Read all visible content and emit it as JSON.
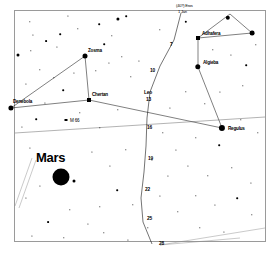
{
  "chart": {
    "type": "star-chart",
    "frame": {
      "x": 14,
      "y": 10,
      "width": 252,
      "height": 232,
      "border_color": "#9a9a9a"
    },
    "background": "#ffffff",
    "ink": "#000000"
  },
  "planet": {
    "name": "Mars",
    "label_x": 36,
    "label_y": 157,
    "disc_x": 61,
    "disc_y": 177,
    "disc_radius": 8.5,
    "companion_x": 74,
    "companion_y": 181,
    "companion_radius": 1.5
  },
  "named_stars": [
    {
      "name": "Zosma",
      "label_x": 88,
      "label_y": 50,
      "star_x": 85,
      "star_y": 56,
      "mag_size": 5.0
    },
    {
      "name": "Chertan",
      "label_x": 92,
      "label_y": 94,
      "star_x": 89,
      "star_y": 100,
      "mag_size": 4.0
    },
    {
      "name": "Denebola",
      "label_x": 13,
      "label_y": 101,
      "star_x": 11,
      "star_y": 108,
      "mag_size": 5.2
    },
    {
      "name": "Adhafera",
      "label_x": 202,
      "label_y": 33,
      "star_x": 198,
      "star_y": 38,
      "mag_size": 4.0
    },
    {
      "name": "Algieba",
      "label_x": 203,
      "label_y": 62,
      "star_x": 198,
      "star_y": 67,
      "mag_size": 5.4
    },
    {
      "name": "Regulus",
      "label_x": 228,
      "label_y": 128,
      "star_x": 222,
      "star_y": 128,
      "mag_size": 6.2
    }
  ],
  "deep_sky_objects": [
    {
      "name": "M 66",
      "label_x": 70,
      "label_y": 120,
      "marker_x": 66,
      "marker_y": 120
    }
  ],
  "top_annotations": [
    {
      "text": "(40?) Eros",
      "x": 176,
      "y": 5
    },
    {
      "text": "1 Jan",
      "x": 178,
      "y": 11
    }
  ],
  "path_markers": [
    {
      "label": "7",
      "x": 170,
      "y": 44
    },
    {
      "label": "10",
      "x": 150,
      "y": 70
    },
    {
      "label": "Leo",
      "x": 144,
      "y": 92
    },
    {
      "label": "13",
      "x": 146,
      "y": 99
    },
    {
      "label": "16",
      "x": 147,
      "y": 127
    },
    {
      "label": "19",
      "x": 148,
      "y": 158
    },
    {
      "label": "22",
      "x": 145,
      "y": 189
    },
    {
      "label": "25",
      "x": 147,
      "y": 218
    },
    {
      "label": "28",
      "x": 159,
      "y": 243
    }
  ],
  "constellation_lines": [
    {
      "from": [
        11,
        108
      ],
      "to": [
        85,
        56
      ]
    },
    {
      "from": [
        85,
        56
      ],
      "to": [
        89,
        100
      ]
    },
    {
      "from": [
        11,
        108
      ],
      "to": [
        89,
        100
      ]
    },
    {
      "from": [
        89,
        100
      ],
      "to": [
        222,
        128
      ]
    },
    {
      "from": [
        198,
        67
      ],
      "to": [
        222,
        128
      ]
    },
    {
      "from": [
        198,
        67
      ],
      "to": [
        198,
        38
      ]
    },
    {
      "from": [
        198,
        38
      ],
      "to": [
        252,
        33
      ]
    },
    {
      "from": [
        252,
        33
      ],
      "to": [
        230,
        14
      ]
    },
    {
      "from": [
        230,
        14
      ],
      "to": [
        198,
        38
      ]
    }
  ],
  "path_line": [
    [
      181,
      13
    ],
    [
      174,
      40
    ],
    [
      160,
      66
    ],
    [
      150,
      92
    ],
    [
      147,
      118
    ],
    [
      146,
      146
    ],
    [
      144,
      172
    ],
    [
      141,
      198
    ],
    [
      143,
      222
    ],
    [
      152,
      244
    ]
  ],
  "ecliptic_line": {
    "from": [
      15,
      133
    ],
    "to": [
      265,
      117
    ]
  },
  "corner_lines": [
    {
      "from": [
        15,
        206
      ],
      "to": [
        32,
        158
      ]
    },
    {
      "from": [
        19,
        208
      ],
      "to": [
        36,
        160
      ]
    },
    {
      "from": [
        160,
        245
      ],
      "to": [
        265,
        228
      ]
    },
    {
      "from": [
        160,
        245
      ],
      "to": [
        240,
        238
      ]
    }
  ],
  "field_stars": [
    {
      "x": 30,
      "y": 22,
      "r": 0.7
    },
    {
      "x": 46,
      "y": 41,
      "r": 0.9
    },
    {
      "x": 31,
      "y": 51,
      "r": 0.7
    },
    {
      "x": 18,
      "y": 55,
      "r": 1.5
    },
    {
      "x": 60,
      "y": 34,
      "r": 0.8
    },
    {
      "x": 57,
      "y": 47,
      "r": 0.6
    },
    {
      "x": 33,
      "y": 35,
      "r": 0.6
    },
    {
      "x": 68,
      "y": 16,
      "r": 0.6
    },
    {
      "x": 78,
      "y": 29,
      "r": 0.7
    },
    {
      "x": 99,
      "y": 24,
      "r": 0.8
    },
    {
      "x": 104,
      "y": 44,
      "r": 0.8
    },
    {
      "x": 112,
      "y": 36,
      "r": 0.7
    },
    {
      "x": 118,
      "y": 19,
      "r": 1.6
    },
    {
      "x": 126,
      "y": 16,
      "r": 0.8
    },
    {
      "x": 122,
      "y": 57,
      "r": 0.7
    },
    {
      "x": 109,
      "y": 63,
      "r": 0.6
    },
    {
      "x": 96,
      "y": 71,
      "r": 0.7
    },
    {
      "x": 74,
      "y": 73,
      "r": 0.6
    },
    {
      "x": 54,
      "y": 78,
      "r": 0.7
    },
    {
      "x": 40,
      "y": 70,
      "r": 0.7
    },
    {
      "x": 26,
      "y": 84,
      "r": 0.6
    },
    {
      "x": 63,
      "y": 90,
      "r": 0.8
    },
    {
      "x": 80,
      "y": 113,
      "r": 0.7
    },
    {
      "x": 45,
      "y": 103,
      "r": 0.6
    },
    {
      "x": 36,
      "y": 119,
      "r": 0.8
    },
    {
      "x": 22,
      "y": 127,
      "r": 0.6
    },
    {
      "x": 100,
      "y": 128,
      "r": 0.7
    },
    {
      "x": 118,
      "y": 110,
      "r": 0.7
    },
    {
      "x": 131,
      "y": 77,
      "r": 0.7
    },
    {
      "x": 139,
      "y": 61,
      "r": 0.6
    },
    {
      "x": 160,
      "y": 30,
      "r": 0.7
    },
    {
      "x": 186,
      "y": 22,
      "r": 1.2
    },
    {
      "x": 213,
      "y": 50,
      "r": 0.7
    },
    {
      "x": 231,
      "y": 55,
      "r": 0.6
    },
    {
      "x": 246,
      "y": 65,
      "r": 0.8
    },
    {
      "x": 256,
      "y": 45,
      "r": 0.7
    },
    {
      "x": 243,
      "y": 86,
      "r": 0.7
    },
    {
      "x": 220,
      "y": 92,
      "r": 0.6
    },
    {
      "x": 205,
      "y": 104,
      "r": 0.7
    },
    {
      "x": 186,
      "y": 92,
      "r": 0.7
    },
    {
      "x": 170,
      "y": 108,
      "r": 0.6
    },
    {
      "x": 241,
      "y": 120,
      "r": 0.7
    },
    {
      "x": 258,
      "y": 133,
      "r": 0.7
    },
    {
      "x": 219,
      "y": 145,
      "r": 0.8
    },
    {
      "x": 196,
      "y": 138,
      "r": 0.7
    },
    {
      "x": 176,
      "y": 150,
      "r": 0.6
    },
    {
      "x": 163,
      "y": 133,
      "r": 0.7
    },
    {
      "x": 188,
      "y": 166,
      "r": 0.6
    },
    {
      "x": 208,
      "y": 176,
      "r": 0.7
    },
    {
      "x": 232,
      "y": 168,
      "r": 0.7
    },
    {
      "x": 251,
      "y": 183,
      "r": 0.6
    },
    {
      "x": 237,
      "y": 198,
      "r": 0.8
    },
    {
      "x": 215,
      "y": 205,
      "r": 0.6
    },
    {
      "x": 196,
      "y": 196,
      "r": 0.7
    },
    {
      "x": 178,
      "y": 212,
      "r": 0.7
    },
    {
      "x": 160,
      "y": 196,
      "r": 0.6
    },
    {
      "x": 133,
      "y": 205,
      "r": 0.7
    },
    {
      "x": 117,
      "y": 190,
      "r": 0.8
    },
    {
      "x": 100,
      "y": 207,
      "r": 0.7
    },
    {
      "x": 88,
      "y": 224,
      "r": 0.6
    },
    {
      "x": 104,
      "y": 233,
      "r": 0.7
    },
    {
      "x": 70,
      "y": 210,
      "r": 0.7
    },
    {
      "x": 48,
      "y": 222,
      "r": 0.9
    },
    {
      "x": 32,
      "y": 236,
      "r": 0.6
    },
    {
      "x": 64,
      "y": 238,
      "r": 0.7
    },
    {
      "x": 26,
      "y": 198,
      "r": 0.6
    },
    {
      "x": 40,
      "y": 186,
      "r": 0.6
    },
    {
      "x": 148,
      "y": 228,
      "r": 0.7
    },
    {
      "x": 128,
      "y": 240,
      "r": 0.6
    },
    {
      "x": 200,
      "y": 228,
      "r": 0.7
    },
    {
      "x": 224,
      "y": 232,
      "r": 0.6
    },
    {
      "x": 252,
      "y": 215,
      "r": 0.7
    },
    {
      "x": 168,
      "y": 176,
      "r": 0.6
    },
    {
      "x": 152,
      "y": 160,
      "r": 0.6
    },
    {
      "x": 126,
      "y": 150,
      "r": 0.7
    },
    {
      "x": 110,
      "y": 166,
      "r": 0.6
    },
    {
      "x": 92,
      "y": 152,
      "r": 0.6
    },
    {
      "x": 30,
      "y": 148,
      "r": 0.6
    },
    {
      "x": 228,
      "y": 18,
      "r": 2.2
    },
    {
      "x": 252,
      "y": 33,
      "r": 2.4
    }
  ]
}
